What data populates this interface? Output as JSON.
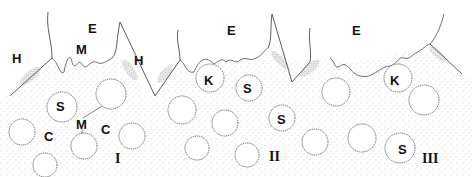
{
  "figure": {
    "panels": [
      "I",
      "II",
      "III"
    ],
    "labels": [
      {
        "text": "H",
        "x": 12,
        "y": 52
      },
      {
        "text": "E",
        "x": 88,
        "y": 22
      },
      {
        "text": "M",
        "x": 76,
        "y": 43
      },
      {
        "text": "H",
        "x": 134,
        "y": 54
      },
      {
        "text": "S",
        "x": 56,
        "y": 104
      },
      {
        "text": "M",
        "x": 76,
        "y": 120
      },
      {
        "text": "C",
        "x": 44,
        "y": 133
      },
      {
        "text": "C",
        "x": 101,
        "y": 125
      },
      {
        "text": "E",
        "x": 227,
        "y": 24
      },
      {
        "text": "K",
        "x": 204,
        "y": 76
      },
      {
        "text": "S",
        "x": 243,
        "y": 82
      },
      {
        "text": "S",
        "x": 277,
        "y": 113
      },
      {
        "text": "E",
        "x": 352,
        "y": 24
      },
      {
        "text": "K",
        "x": 390,
        "y": 74
      },
      {
        "text": "S",
        "x": 398,
        "y": 143
      }
    ],
    "roman": [
      {
        "text": "I",
        "x": 115,
        "y": 152
      },
      {
        "text": "II",
        "x": 269,
        "y": 150
      },
      {
        "text": "III",
        "x": 422,
        "y": 152
      }
    ]
  }
}
